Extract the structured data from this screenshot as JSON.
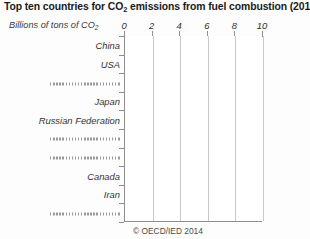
{
  "chart_data": {
    "type": "bar",
    "orientation": "horizontal",
    "title": "Top ten countries for CO2 emissions from fuel combustion (2012)",
    "title_parts": {
      "before": "Top ten countries for CO",
      "sub": "2",
      "after": " emissions from fuel combustion (2012)"
    },
    "xlabel_parts": {
      "before": "Billions of tons of CO",
      "sub": "2",
      "after": ""
    },
    "xlabel": "Billions of tons of CO2",
    "ylabel": "",
    "xlim": [
      0,
      10
    ],
    "xticks": [
      "0",
      "2",
      "4",
      "6",
      "8",
      "10"
    ],
    "xtick_values": [
      0,
      2,
      4,
      6,
      8,
      10
    ],
    "grid": "vertical",
    "legend": "none",
    "categories": [
      "China",
      "USA",
      "...................",
      "Japan",
      "Russian Federation",
      "...................",
      "...................",
      "Canada",
      "Iran",
      "..................."
    ],
    "category_redacted": [
      false,
      false,
      true,
      false,
      false,
      true,
      true,
      false,
      false,
      true
    ],
    "values": [
      null,
      null,
      null,
      null,
      null,
      null,
      null,
      null,
      null,
      null
    ],
    "annotations": [
      "© OECD/IED 2014"
    ],
    "credit": "© OECD/IED 2014",
    "colors": {
      "page_background": "#fdfdfd",
      "plot_background": "#ffffff",
      "axis": "#8e8e8e",
      "gridline": "#c9c9c9",
      "text": "#333333",
      "title_text": "#1a1a1a"
    }
  }
}
